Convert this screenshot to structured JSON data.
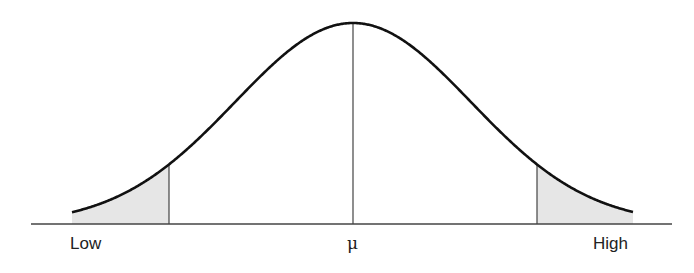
{
  "diagram": {
    "type": "normal-distribution-curve",
    "labels": {
      "left": "Low",
      "center": "μ",
      "right": "High"
    },
    "colors": {
      "curve": "#111111",
      "axis": "#444444",
      "tail_fill": "#e6e6e6"
    },
    "shaded_regions": [
      "left-tail",
      "right-tail"
    ]
  }
}
